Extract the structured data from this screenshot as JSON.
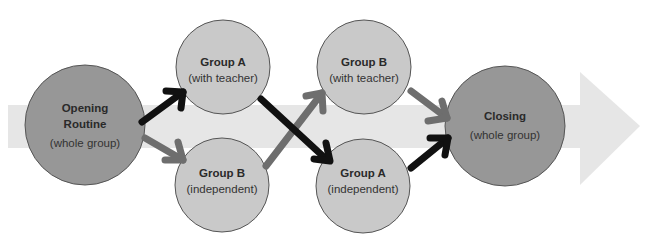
{
  "colors": {
    "background": "#ffffff",
    "band": "#e6e6e6",
    "dark_circle": "#979797",
    "light_circle": "#c9c9c9",
    "circle_stroke": "#555555",
    "arrow_black": "#111111",
    "arrow_gray": "#6e6e6e"
  },
  "nodes": [
    {
      "id": "opening",
      "title": "Opening",
      "title2": "Routine",
      "sub": "(whole group)"
    },
    {
      "id": "group-a-teacher",
      "title": "Group A",
      "sub": "(with teacher)"
    },
    {
      "id": "group-b-independent",
      "title": "Group B",
      "sub": "(independent)"
    },
    {
      "id": "group-b-teacher",
      "title": "Group B",
      "sub": "(with teacher)"
    },
    {
      "id": "group-a-independent",
      "title": "Group A",
      "sub": "(independent)"
    },
    {
      "id": "closing",
      "title": "Closing",
      "sub": "(whole group)"
    }
  ],
  "edges": [
    {
      "from": "opening",
      "to": "group-a-teacher",
      "color": "black"
    },
    {
      "from": "opening",
      "to": "group-b-independent",
      "color": "gray"
    },
    {
      "from": "group-a-teacher",
      "to": "group-a-independent",
      "color": "black"
    },
    {
      "from": "group-b-independent",
      "to": "group-b-teacher",
      "color": "gray"
    },
    {
      "from": "group-b-teacher",
      "to": "closing",
      "color": "gray"
    },
    {
      "from": "group-a-independent",
      "to": "closing",
      "color": "black"
    }
  ]
}
